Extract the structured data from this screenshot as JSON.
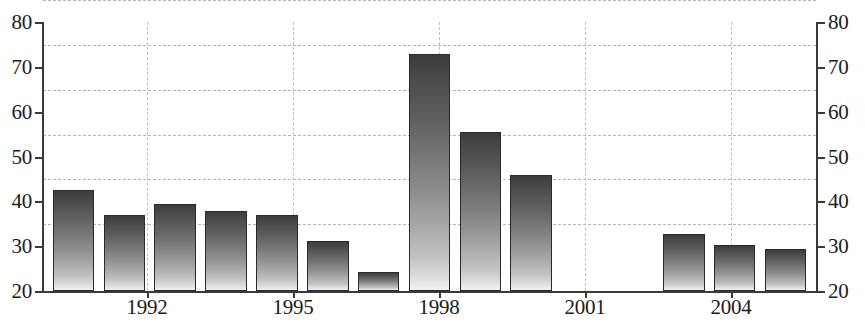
{
  "chart_data": {
    "type": "bar",
    "title": "",
    "subtitle": "",
    "xlabel": "",
    "ylabel": "",
    "ylabel_right": "",
    "ylim": [
      20,
      80
    ],
    "xlim": [
      1990.4,
      2005.6
    ],
    "grid": true,
    "legend": null,
    "dual_y_axis": true,
    "y_ticks": [
      80,
      70,
      60,
      50,
      40,
      30,
      20
    ],
    "y_ticks_right": [
      80,
      70,
      60,
      50,
      40,
      30,
      20
    ],
    "x_ticks": [
      1992,
      1995,
      1998,
      2001,
      2004
    ],
    "x_tick_labels": [
      "1992",
      "1995",
      "1998",
      "2001",
      "2004"
    ],
    "categories": [
      "1991",
      "1992",
      "1993",
      "1994",
      "1995",
      "1996",
      "1997",
      "1998",
      "1999",
      "2000",
      "2001",
      "2002",
      "2003",
      "2004",
      "2005"
    ],
    "values": [
      42.5,
      37.0,
      39.4,
      37.9,
      37.0,
      31.1,
      24.2,
      72.8,
      55.5,
      45.8,
      null,
      null,
      32.7,
      30.2,
      29.3
    ],
    "bar_fill": "vertical-gradient-dark-to-light",
    "bar_edge_color": "#2a2a2a",
    "axis_color": "#3a3a3a",
    "gridline_color": "#b4b4b4",
    "background_color": "#ffffff",
    "text_color": "#1b1b1b"
  }
}
